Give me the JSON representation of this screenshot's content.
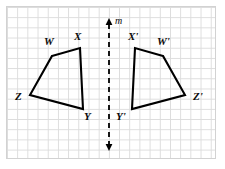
{
  "figure": {
    "background_color": "#ffffff",
    "grid": {
      "visible": true,
      "line_color": "#dcdcdc",
      "cell_size": 10.2,
      "border_color": "#d2d2d2"
    },
    "stroke_color": "#000000",
    "mirror_line": {
      "name": "m",
      "label": "m",
      "label_x": 115,
      "label_y": 16,
      "x": 109,
      "y_top": 18,
      "y_bottom": 151,
      "style": "dashed",
      "arrow_both_ends": true
    },
    "shapes": [
      {
        "name": "quadrilateral-wxyz",
        "vertices": [
          {
            "label": "W",
            "x": 52,
            "y": 56,
            "label_x": 44,
            "label_y": 36
          },
          {
            "label": "X",
            "x": 80,
            "y": 48,
            "label_x": 74,
            "label_y": 31
          },
          {
            "label": "Y",
            "x": 83,
            "y": 109,
            "label_x": 84,
            "label_y": 111
          },
          {
            "label": "Z",
            "x": 30,
            "y": 95,
            "label_x": 15,
            "label_y": 91
          }
        ]
      },
      {
        "name": "quadrilateral-wxyz-prime",
        "vertices": [
          {
            "label": "W'",
            "x": 163,
            "y": 56,
            "label_x": 157,
            "label_y": 36
          },
          {
            "label": "X'",
            "x": 135,
            "y": 48,
            "label_x": 128,
            "label_y": 31
          },
          {
            "label": "Y'",
            "x": 132,
            "y": 109,
            "label_x": 116,
            "label_y": 111
          },
          {
            "label": "Z'",
            "x": 185,
            "y": 95,
            "label_x": 193,
            "label_y": 91
          }
        ]
      }
    ]
  }
}
